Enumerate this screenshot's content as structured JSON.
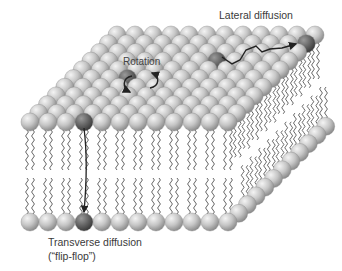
{
  "figure": {
    "labels": {
      "lateral": "Lateral diffusion",
      "rotation": "Rotation",
      "transverse": "Transverse diffusion",
      "flipflop": "(“flip-flop”)"
    },
    "colors": {
      "head_light": "#c9c9c9",
      "head_dark": "#6b6b6b",
      "tail": "#555555",
      "arrow": "#222222",
      "background": "#ffffff"
    },
    "structure": {
      "heads_per_row": 12,
      "top_surface_rows": 11,
      "leaflets": 2,
      "highlighted_lipids": [
        "rotation-lipid",
        "lateral-start-lipid",
        "lateral-end-lipid",
        "flipflop-top-lipid",
        "flipflop-bottom-lipid"
      ]
    }
  }
}
